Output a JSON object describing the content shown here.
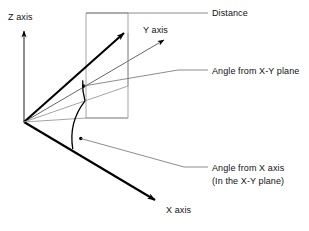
{
  "diagram": {
    "background_color": "#ffffff",
    "stroke_dark": "#000000",
    "stroke_light": "#9a9a9a",
    "labels": {
      "z_axis": "Z axis",
      "y_axis": "Y axis",
      "x_axis": "X axis",
      "distance": "Distance",
      "angle_from_xy_plane": "Angle from X-Y plane",
      "angle_from_x_axis": "Angle from X axis",
      "angle_from_x_axis_note": "(In the X-Y plane)"
    },
    "geometry": {
      "origin": [
        24,
        122
      ],
      "z_axis_tip": [
        24,
        28
      ],
      "x_axis_tip": [
        158,
        202
      ],
      "y_axis_tip": [
        168,
        38
      ],
      "distance_vector_tip": [
        126,
        31
      ],
      "plane_rect": [
        [
          86,
          13
        ],
        [
          128,
          13
        ],
        [
          128,
          118
        ],
        [
          86,
          118
        ]
      ],
      "elevation_arc_radius": 62,
      "azimuth_arc_radius": 62
    }
  }
}
